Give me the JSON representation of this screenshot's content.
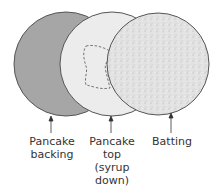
{
  "diagram": {
    "layers": [
      {
        "name": "Pancake backing",
        "fill": "#a9a9a9"
      },
      {
        "name": "Pancake top (syrup down)",
        "fill": "#ebebeb"
      },
      {
        "name": "Batting",
        "fill": "#dcdcdc"
      }
    ],
    "labels": {
      "backing_line1": "Pancake",
      "backing_line2": "backing",
      "top_line1": "Pancake",
      "top_line2": "top",
      "top_line3": "(syrup",
      "top_line4": "down)",
      "batting_line1": "Batting"
    }
  }
}
